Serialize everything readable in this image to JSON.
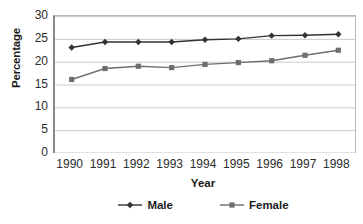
{
  "chart_data": {
    "type": "line",
    "title": "",
    "xlabel": "Year",
    "ylabel": "Percentage",
    "categories": [
      "1990",
      "1991",
      "1992",
      "1993",
      "1994",
      "1995",
      "1996",
      "1997",
      "1998"
    ],
    "series": [
      {
        "name": "Male",
        "marker": "diamond",
        "color": "#333333",
        "values": [
          23.1,
          24.3,
          24.3,
          24.3,
          24.8,
          25.0,
          25.7,
          25.8,
          26.0
        ]
      },
      {
        "name": "Female",
        "marker": "square",
        "color": "#6e6e6e",
        "values": [
          16.1,
          18.5,
          19.0,
          18.7,
          19.4,
          19.8,
          20.2,
          21.4,
          22.5
        ]
      }
    ],
    "ylim": [
      0,
      30
    ],
    "yticks": [
      0,
      5,
      10,
      15,
      20,
      25,
      30
    ],
    "ytick_labels": [
      "0",
      "5",
      "10",
      "15",
      "20",
      "25",
      "30"
    ],
    "grid": "horizontal",
    "legend_position": "bottom"
  },
  "axes": {
    "y_title": "Percentage",
    "x_title": "Year"
  },
  "legend": {
    "entries": [
      {
        "label": "Male"
      },
      {
        "label": "Female"
      }
    ]
  },
  "colors": {
    "male_line": "#333333",
    "female_line": "#6e6e6e",
    "gridline": "#c9c9c9",
    "axis": "#8a8a8a",
    "text": "#1a1a1a"
  },
  "artifact": {
    "bottom_text": ""
  }
}
